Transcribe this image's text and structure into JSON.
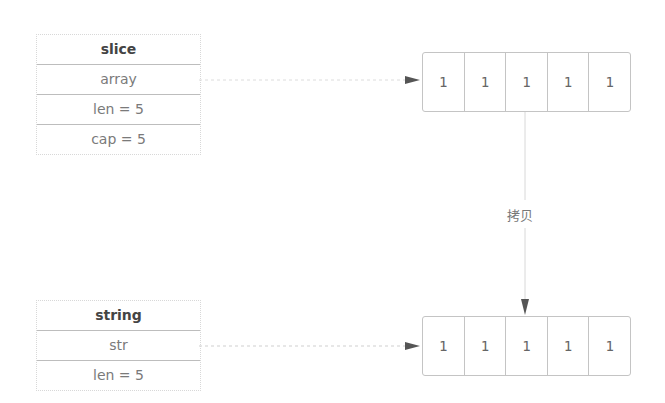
{
  "slice": {
    "title": "slice",
    "fields": [
      "array",
      "len = 5",
      "cap = 5"
    ]
  },
  "string": {
    "title": "string",
    "fields": [
      "str",
      "len = 5"
    ]
  },
  "top_array": {
    "cells": [
      "1",
      "1",
      "1",
      "1",
      "1"
    ]
  },
  "bottom_array": {
    "cells": [
      "1",
      "1",
      "1",
      "1",
      "1"
    ]
  },
  "copy_label": "拷贝",
  "colors": {
    "line": "#d0d0d0",
    "arrow": "#555555",
    "border": "#c4c4c4"
  }
}
